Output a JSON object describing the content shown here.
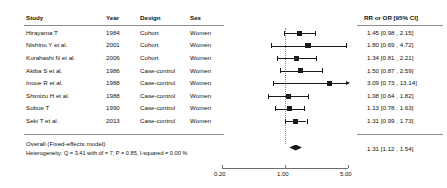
{
  "columns": {
    "study": "Study",
    "year": "Year",
    "design": "Design",
    "sex": "Sex",
    "effect": "RR or OR [95% CI]"
  },
  "rows": [
    {
      "study": "Hirayama T",
      "year": "1984",
      "design": "Cohort",
      "sex": "Women",
      "effect": "1.45 [0.98 ,  2.15]",
      "est": 1.45,
      "lo": 0.98,
      "hi": 2.15,
      "weight": 0.62
    },
    {
      "study": "Nishino Y et al.",
      "year": "2001",
      "design": "Cohort",
      "sex": "Women",
      "effect": "1.80 [0.69 ,  4.72]",
      "est": 1.8,
      "lo": 0.69,
      "hi": 4.72,
      "weight": 0.75
    },
    {
      "study": "Kurahashi N et al.",
      "year": "2006",
      "design": "Cohort",
      "sex": "Women",
      "effect": "1.34 [0.81 ,  2.21]",
      "est": 1.34,
      "lo": 0.81,
      "hi": 2.21,
      "weight": 0.58
    },
    {
      "study": "Akiba S et al.",
      "year": "1986",
      "design": "Case-control",
      "sex": "Women",
      "effect": "1.50 [0.87 ,  2.59]",
      "est": 1.5,
      "lo": 0.87,
      "hi": 2.59,
      "weight": 0.58
    },
    {
      "study": "Inoue R et al.",
      "year": "1988",
      "design": "Case-control",
      "sex": "Women",
      "effect": "3.09 [0.73 , 13.14]",
      "est": 3.09,
      "lo": 0.73,
      "hi": 13.14,
      "weight": 0.55,
      "right_truncated": true
    },
    {
      "study": "Shimizu H et al.",
      "year": "1988",
      "design": "Case-control",
      "sex": "Women",
      "effect": "1.08 [0.64 ,  1.82]",
      "est": 1.08,
      "lo": 0.64,
      "hi": 1.82,
      "weight": 0.6
    },
    {
      "study": "Sobue T",
      "year": "1990",
      "design": "Case-control",
      "sex": "Women",
      "effect": "1.13 [0.78 ,  1.63]",
      "est": 1.13,
      "lo": 0.78,
      "hi": 1.63,
      "weight": 0.58
    },
    {
      "study": "Seki T et al.",
      "year": "2013",
      "design": "Case-control",
      "sex": "Women",
      "effect": "1.31 [0.99 ,  1.73]",
      "est": 1.31,
      "lo": 0.99,
      "hi": 1.73,
      "weight": 0.55
    }
  ],
  "summary": {
    "label": "Overall (Fixed-effects model)",
    "heterogeneity": "Heterogeneity: Q = 3.41 with df = 7,  P = 0.85,  I-squared = 0.00 %",
    "effect": "1.31 [1.12 ,  1.54]",
    "est": 1.31,
    "lo": 1.12,
    "hi": 1.54
  },
  "chart_data": {
    "type": "forest",
    "title": "",
    "xlabel": "",
    "ylabel": "",
    "scale": "log",
    "xlim": [
      0.2,
      5.0
    ],
    "null_value": 1.0,
    "xticks": [
      0.2,
      1.0,
      5.0
    ],
    "xticklabels": [
      "0.20",
      "1.00",
      "5.00"
    ],
    "effect_measure": "RR or OR [95% CI]",
    "model": "Fixed-effects",
    "categories": [
      "Hirayama T",
      "Nishino Y et al.",
      "Kurahashi N et al.",
      "Akiba S et al.",
      "Inoue R et al.",
      "Shimizu H et al.",
      "Sobue T",
      "Seki T et al."
    ],
    "values": [
      1.45,
      1.8,
      1.34,
      1.5,
      3.09,
      1.08,
      1.13,
      1.31
    ],
    "ci_lower": [
      0.98,
      0.69,
      0.81,
      0.87,
      0.73,
      0.64,
      0.78,
      0.99
    ],
    "ci_upper": [
      2.15,
      4.72,
      2.21,
      2.59,
      13.14,
      1.82,
      1.63,
      1.73
    ],
    "pooled": {
      "value": 1.31,
      "ci_lower": 1.12,
      "ci_upper": 1.54
    },
    "heterogeneity_stats": {
      "Q": 3.41,
      "df": 7,
      "P": 0.85,
      "I_squared": "0.00 %"
    },
    "grid": false,
    "legend": "none"
  }
}
